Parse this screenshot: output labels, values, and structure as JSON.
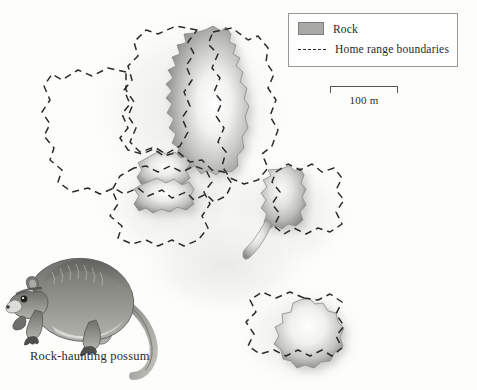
{
  "figure": {
    "background_color": "#fdfdfc",
    "caption": "Rock-haunting possum"
  },
  "legend": {
    "items": [
      {
        "label": "Rock",
        "symbol": "filled-gray-swatch",
        "color": "#a9a9a7"
      },
      {
        "label": "Home range boundaries",
        "symbol": "dashed-line",
        "color": "#2b2b2b"
      }
    ]
  },
  "scale": {
    "label": "100 m",
    "length_px": 68
  },
  "map": {
    "rock_fill_light": "#ffffff",
    "rock_fill_mid": "#c9c9c6",
    "rock_fill_dark": "#8f8f8c",
    "boundary_color": "#2b2b2b",
    "halo_color": "#eeeeeb",
    "features": [
      {
        "name": "large-northern-rock-outcrop"
      },
      {
        "name": "small-rock-lobe-upper"
      },
      {
        "name": "small-rock-lobe-lower"
      },
      {
        "name": "middle-rock-outcrop"
      },
      {
        "name": "southern-rock-outcrop"
      }
    ],
    "home_ranges": [
      {
        "name": "home-range-north-west"
      },
      {
        "name": "home-range-north-east"
      },
      {
        "name": "home-range-west-lobe"
      },
      {
        "name": "home-range-south-lobe"
      },
      {
        "name": "home-range-middle"
      },
      {
        "name": "home-range-southern"
      }
    ]
  },
  "illustration": {
    "name": "rock-haunting-possum-drawing",
    "body_color": "#8a8a86",
    "belly_color": "#d8d8d4"
  }
}
